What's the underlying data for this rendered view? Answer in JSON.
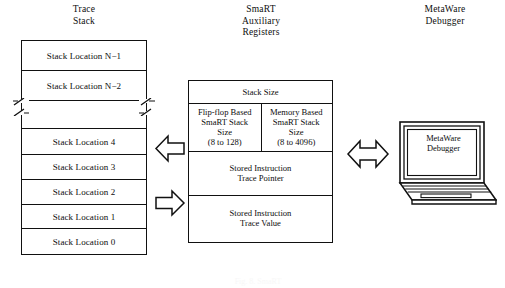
{
  "figure": {
    "kind": "block-diagram",
    "background_color": "#ffffff",
    "line_color": "#111111",
    "text_color": "#0d0d0d",
    "bottom_caption": "Fig. 8. SmaRT"
  },
  "columns": {
    "trace_stack_title": "Trace\nStack",
    "aux_registers_title": "SmaRT\nAuxiliary\nRegisters",
    "debugger_title": "MetaWare\nDebugger"
  },
  "trace_stack": {
    "name": "Trace Stack",
    "rows": [
      {
        "label": "Stack Location N−1",
        "type": "cell"
      },
      {
        "label": "Stack Location N−2",
        "type": "cell"
      },
      {
        "label": "",
        "type": "break"
      },
      {
        "label": "Stack Location 4",
        "type": "cell"
      },
      {
        "label": "Stack Location 3",
        "type": "cell"
      },
      {
        "label": "Stack Location 2",
        "type": "cell"
      },
      {
        "label": "Stack Location 1",
        "type": "cell"
      },
      {
        "label": "Stack Location 0",
        "type": "cell"
      }
    ]
  },
  "aux_registers": {
    "name": "SmaRT Auxiliary Registers",
    "stack_size_header": "Stack Size",
    "flip_flop_cell": "Flip-flop Based\nSmaRT Stack\nSize\n(8 to 128)",
    "memory_cell": "Memory Based\nSmaRT Stack\nSize\n(8 to 4096)",
    "trace_pointer": "Stored Instruction\nTrace Pointer",
    "trace_value": "Stored Instruction\nTrace Value"
  },
  "debugger": {
    "name": "MetaWare Debugger",
    "screen_label": "MetaWare\nDebugger"
  },
  "arrows": {
    "stack_to_registers": {
      "direction": "left",
      "icon": "block-arrow-left-icon"
    },
    "registers_to_stack": {
      "direction": "right",
      "icon": "block-arrow-right-icon"
    },
    "registers_to_debugger": {
      "direction": "both",
      "icon": "block-arrow-double-icon"
    }
  }
}
